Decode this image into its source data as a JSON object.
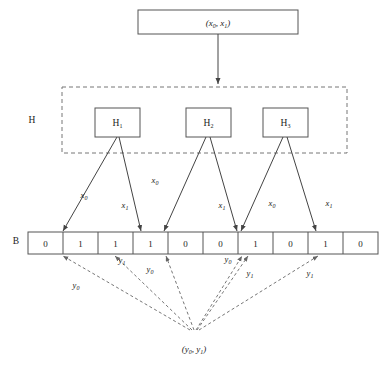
{
  "figure": {
    "type": "diagram"
  },
  "input_node": {
    "label": "(x0, x1)",
    "base": "(",
    "var1": "x",
    "sub1": "0",
    "sep": ", ",
    "var2": "x",
    "sub2": "1",
    "close": ")"
  },
  "hash_group": {
    "label": "H",
    "boxes": [
      {
        "name": "H1",
        "base": "H",
        "sub": "1"
      },
      {
        "name": "H2",
        "base": "H",
        "sub": "2"
      },
      {
        "name": "H3",
        "base": "H",
        "sub": "3"
      }
    ]
  },
  "bit_array": {
    "label": "B",
    "cells": [
      "0",
      "1",
      "1",
      "1",
      "0",
      "0",
      "1",
      "0",
      "1",
      "0"
    ]
  },
  "edge_labels_upper": [
    {
      "var": "x",
      "sub": "0"
    },
    {
      "var": "x",
      "sub": "1"
    },
    {
      "var": "x",
      "sub": "0"
    },
    {
      "var": "x",
      "sub": "1"
    },
    {
      "var": "x",
      "sub": "0"
    },
    {
      "var": "x",
      "sub": "1"
    }
  ],
  "edge_labels_lower": [
    {
      "var": "y",
      "sub": "0"
    },
    {
      "var": "y",
      "sub": "1"
    },
    {
      "var": "y",
      "sub": "0"
    },
    {
      "var": "y",
      "sub": "0"
    },
    {
      "var": "y",
      "sub": "1"
    },
    {
      "var": "y",
      "sub": "1"
    }
  ],
  "output_node": {
    "label": "(y0, y1)",
    "base": "(",
    "var1": "y",
    "sub1": "0",
    "sep": ", ",
    "var2": "y",
    "sub2": "1",
    "close": ")"
  },
  "colors": {
    "stroke": "#555555",
    "dash_stroke": "#777777",
    "text": "#1a1a1a",
    "background": "#ffffff"
  }
}
